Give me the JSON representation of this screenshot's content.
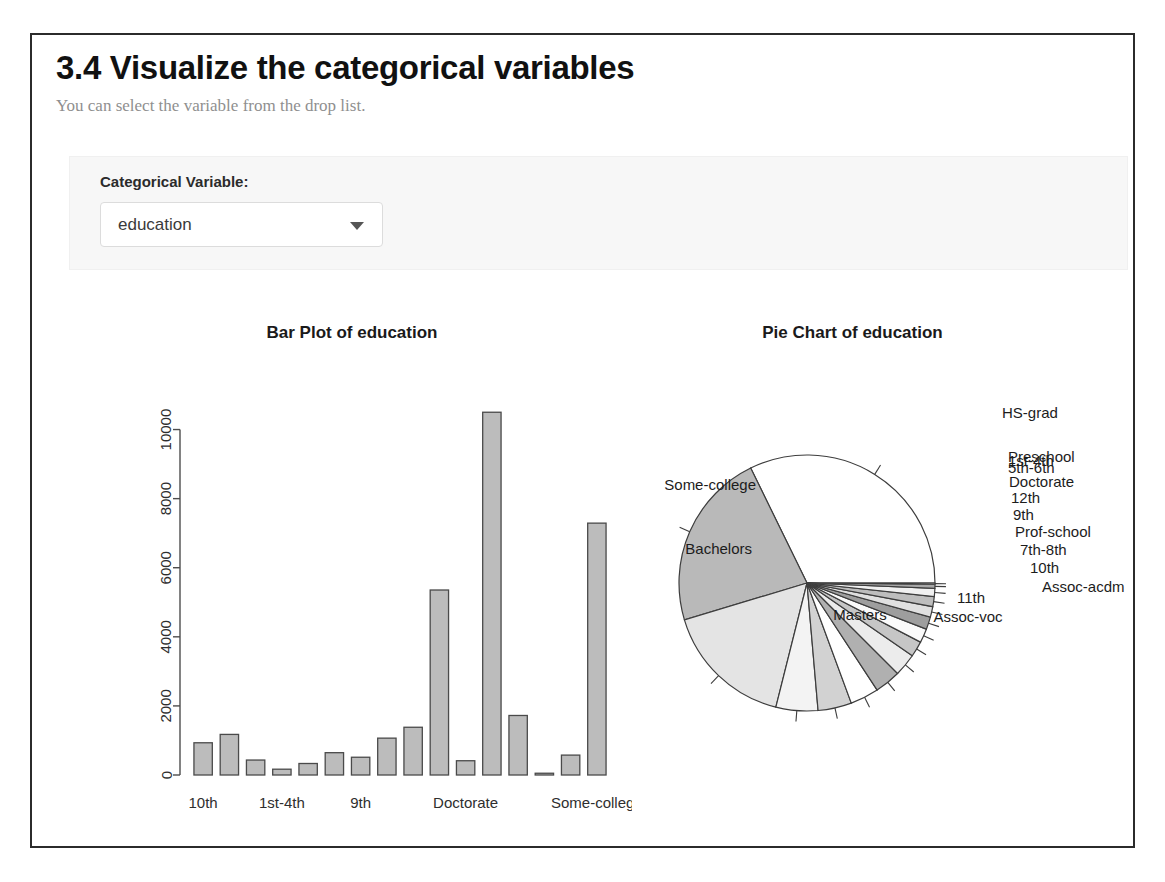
{
  "header": {
    "title": "3.4 Visualize the categorical variables",
    "subtitle": "You can select the variable from the drop list."
  },
  "controls": {
    "label": "Categorical Variable:",
    "select": {
      "name": "categorical-variable-select",
      "value": "education",
      "caret_icon": "chevron-down-icon"
    }
  },
  "colors": {
    "frame_border": "#2b2b2b",
    "well_background": "#f7f7f7",
    "bar_fill": "#bcbcbc",
    "bar_stroke": "#4a4a4a",
    "text_primary": "#111111",
    "text_muted": "#8f8f8f"
  },
  "chart_data": [
    {
      "type": "bar",
      "title": "Bar Plot of education",
      "xlabel": "",
      "ylabel": "",
      "ylim": [
        0,
        11000
      ],
      "grid": false,
      "yticks": [
        0,
        2000,
        4000,
        6000,
        8000,
        10000
      ],
      "ytick_labels": [
        "0",
        "2000",
        "4000",
        "6000",
        "8000",
        "10000"
      ],
      "visible_xtick_labels": [
        "10th",
        "1st-4th",
        "9th",
        "Doctorate",
        "Some-college"
      ],
      "categories": [
        "10th",
        "11th",
        "12th",
        "1st-4th",
        "5th-6th",
        "7th-8th",
        "9th",
        "Assoc-acdm",
        "Assoc-voc",
        "Bachelors",
        "Doctorate",
        "HS-grad",
        "Masters",
        "Preschool",
        "Prof-school",
        "Some-college"
      ],
      "values": [
        933,
        1175,
        433,
        168,
        333,
        646,
        514,
        1067,
        1382,
        5355,
        413,
        10501,
        1723,
        51,
        576,
        7291
      ]
    },
    {
      "type": "pie",
      "title": "Pie Chart of education",
      "legend_position": "callout-labels",
      "start_angle_deg": 0,
      "direction": "counterclockwise",
      "labels": [
        "HS-grad",
        "Some-college",
        "Bachelors",
        "Masters",
        "Assoc-voc",
        "11th",
        "Assoc-acdm",
        "10th",
        "7th-8th",
        "Prof-school",
        "9th",
        "12th",
        "Doctorate",
        "5th-6th",
        "1st-4th",
        "Preschool"
      ],
      "values": [
        10501,
        7291,
        5355,
        1723,
        1382,
        1175,
        1067,
        933,
        646,
        576,
        514,
        433,
        413,
        333,
        168,
        51
      ]
    }
  ]
}
